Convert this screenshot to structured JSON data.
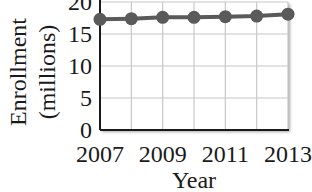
{
  "chart_data": {
    "type": "line",
    "title": "",
    "xlabel": "Year",
    "ylabel_line1": "Enrollment",
    "ylabel_line2": "(millions)",
    "ylabel": "Enrollment (millions)",
    "x": [
      2007,
      2008,
      2009,
      2010,
      2011,
      2012,
      2013
    ],
    "x_tick_labels": [
      "2007",
      "2009",
      "2011",
      "2013"
    ],
    "y_tick_labels": [
      "0",
      "5",
      "10",
      "15",
      "20"
    ],
    "series": [
      {
        "name": "Enrollment",
        "values": [
          17.3,
          17.4,
          17.6,
          17.6,
          17.7,
          17.8,
          18.1
        ],
        "color": "#5a5a5a"
      }
    ],
    "ylim": [
      0,
      20
    ],
    "xlim": [
      2007,
      2013
    ],
    "grid": true,
    "legend": "none"
  }
}
